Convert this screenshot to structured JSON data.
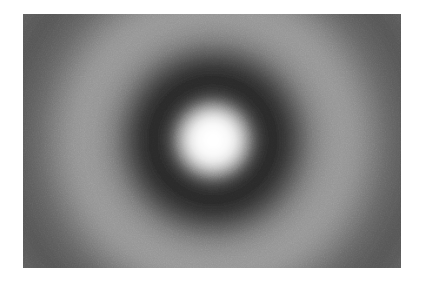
{
  "figure": {
    "kind": "grayscale-raster-image",
    "canvas": {
      "width": 423,
      "height": 283,
      "background_color": "#ffffff"
    },
    "plate": {
      "x": 23,
      "y": 14,
      "width": 378,
      "height": 254,
      "base_color": "#8a8a8a"
    }
  },
  "chart_data": {
    "type": "heatmap",
    "title": "",
    "subtitle": "",
    "xlabel": "",
    "ylabel": "",
    "grid": false,
    "legend": "none",
    "colormap": "gray",
    "value_range": [
      0,
      255
    ],
    "symmetry": "radial",
    "center": {
      "x": 190,
      "y": 126
    },
    "noise": {
      "type": "film-grain",
      "amplitude": 10
    },
    "radial_profile": {
      "xlabel": "radius (px)",
      "ylabel": "intensity (0-255 gray)",
      "radii": [
        0,
        8,
        16,
        22,
        28,
        34,
        40,
        46,
        52,
        58,
        64,
        72,
        80,
        90,
        100,
        110,
        120,
        130,
        140,
        150,
        162,
        175,
        190,
        205,
        220,
        240,
        260
      ],
      "values": [
        255,
        254,
        248,
        232,
        198,
        150,
        100,
        66,
        48,
        42,
        44,
        55,
        74,
        100,
        124,
        140,
        148,
        150,
        146,
        136,
        120,
        104,
        92,
        86,
        90,
        100,
        112
      ]
    },
    "rings": [
      {
        "name": "central-core",
        "type": "bright",
        "inner_radius": 0,
        "outer_radius": 24,
        "peak_radius": 0,
        "gray": 255,
        "hex": "#ffffff"
      },
      {
        "name": "first-dark-ring",
        "type": "dark",
        "inner_radius": 30,
        "outer_radius": 70,
        "peak_radius": 52,
        "gray": 42,
        "hex": "#2a2a2a"
      },
      {
        "name": "second-bright-ring",
        "type": "bright",
        "inner_radius": 78,
        "outer_radius": 150,
        "peak_radius": 122,
        "gray": 150,
        "hex": "#969696"
      },
      {
        "name": "second-dark-ring",
        "type": "dark",
        "inner_radius": 160,
        "outer_radius": 220,
        "peak_radius": 196,
        "gray": 86,
        "hex": "#565656"
      },
      {
        "name": "third-bright-ring",
        "type": "bright",
        "inner_radius": 228,
        "outer_radius": 300,
        "peak_radius": 262,
        "gray": 114,
        "hex": "#727272"
      }
    ]
  }
}
